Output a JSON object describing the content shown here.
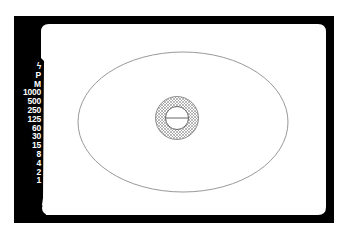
{
  "viewfinder": {
    "frame_color": "#000000",
    "screen_color": "#ffffff",
    "ellipse_stroke": "#999999",
    "ring_pattern_color": "#8a8a8a"
  },
  "shutter_scale": {
    "items": [
      {
        "label": "ϟ",
        "icon": "flash-icon"
      },
      {
        "label": "P"
      },
      {
        "label": "M"
      },
      {
        "label": "1000"
      },
      {
        "label": "500"
      },
      {
        "label": "250"
      },
      {
        "label": "125"
      },
      {
        "label": "60"
      },
      {
        "label": "30"
      },
      {
        "label": "15"
      },
      {
        "label": "8"
      },
      {
        "label": "4"
      },
      {
        "label": "2"
      },
      {
        "label": "1"
      }
    ]
  }
}
